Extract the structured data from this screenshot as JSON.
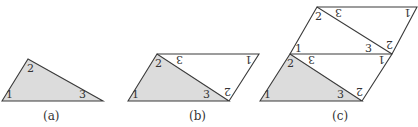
{
  "figure": {
    "panels": [
      {
        "id": "a",
        "caption": "(a)",
        "shaded_triangle": {
          "labels": [
            "1",
            "2",
            "3"
          ]
        },
        "rotated_labels": []
      },
      {
        "id": "b",
        "caption": "(b)",
        "shaded_triangle": {
          "labels": [
            "1",
            "2",
            "3"
          ]
        },
        "rotated_labels": [
          "3",
          "1",
          "2"
        ]
      },
      {
        "id": "c",
        "caption": "(c)",
        "shaded_triangle": {
          "labels": [
            "1",
            "2",
            "3"
          ]
        },
        "rotated_labels": [
          "3",
          "1",
          "2"
        ],
        "upper_upright_labels": [
          "1",
          "3"
        ],
        "upper_upright_labels_top": [
          "2"
        ],
        "upper_rotated_labels": [
          "3",
          "1",
          "2"
        ]
      }
    ],
    "colors": {
      "shade": "#dcdcdc",
      "line": "#3a3a3a"
    }
  }
}
